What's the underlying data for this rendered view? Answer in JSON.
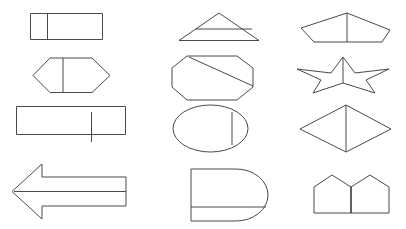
{
  "canvas": {
    "width": 406,
    "height": 229,
    "background_color": "#ffffff",
    "stroke_color": "#4a4a4a",
    "stroke_width": 1,
    "fill": "none",
    "description": "Grid of twelve black-and-white geometric outline figures, three columns by four rows, each shape drawn as thin dark-gray strokes on white with an internal dividing line"
  },
  "grid": {
    "columns": 3,
    "rows": 4,
    "total_shapes": 12
  },
  "shapes": [
    {
      "id": "shape-r1c1",
      "name": "rectangle-with-vertical-divider",
      "row": 1,
      "column": 1,
      "outline_type": "rectangle",
      "divider": "vertical-line-near-left",
      "bounds": {
        "x": 30,
        "y": 13,
        "width": 73,
        "height": 27
      }
    },
    {
      "id": "shape-r1c2",
      "name": "triangle-with-horizontal-divider",
      "row": 1,
      "column": 2,
      "outline_type": "triangle",
      "divider": "horizontal-line",
      "bounds": {
        "x": 178,
        "y": 13,
        "width": 84,
        "height": 28
      }
    },
    {
      "id": "shape-r1c3",
      "name": "pentagon-with-vertical-divider",
      "row": 1,
      "column": 3,
      "outline_type": "flattened-pentagon",
      "divider": "vertical-line-apex-to-base",
      "bounds": {
        "x": 300,
        "y": 13,
        "width": 90,
        "height": 29
      }
    },
    {
      "id": "shape-r2c1",
      "name": "hexagon-with-vertical-divider",
      "row": 2,
      "column": 1,
      "outline_type": "hexagon",
      "divider": "vertical-line-center",
      "bounds": {
        "x": 32,
        "y": 57,
        "width": 78,
        "height": 36
      }
    },
    {
      "id": "shape-r2c2",
      "name": "octagon-with-diagonal-divider",
      "row": 2,
      "column": 2,
      "outline_type": "octagon",
      "divider": "diagonal-line-upper-left-to-right",
      "bounds": {
        "x": 171,
        "y": 55,
        "width": 82,
        "height": 45
      }
    },
    {
      "id": "shape-r2c3",
      "name": "star-with-vertical-divider",
      "row": 2,
      "column": 3,
      "outline_type": "five-pointed-star-wide",
      "divider": "vertical-line-from-top-point",
      "bounds": {
        "x": 296,
        "y": 56,
        "width": 92,
        "height": 37
      }
    },
    {
      "id": "shape-r3c1",
      "name": "wide-rectangle-with-vertical-divider",
      "row": 3,
      "column": 1,
      "outline_type": "rectangle",
      "divider": "vertical-line-right-of-center-overhanging",
      "bounds": {
        "x": 16,
        "y": 106,
        "width": 110,
        "height": 29
      }
    },
    {
      "id": "shape-r3c2",
      "name": "ellipse-with-vertical-chord",
      "row": 3,
      "column": 2,
      "outline_type": "ellipse",
      "divider": "vertical-chord-right-side",
      "bounds": {
        "x": 172,
        "y": 104,
        "width": 76,
        "height": 48
      }
    },
    {
      "id": "shape-r3c3",
      "name": "rhombus-with-vertical-divider",
      "row": 3,
      "column": 3,
      "outline_type": "rhombus",
      "divider": "vertical-line-top-to-bottom-vertex",
      "bounds": {
        "x": 299,
        "y": 104,
        "width": 92,
        "height": 48
      }
    },
    {
      "id": "shape-r4c1",
      "name": "left-arrow-with-horizontal-divider",
      "row": 4,
      "column": 1,
      "outline_type": "left-pointing-block-arrow",
      "divider": "horizontal-line-through-shaft",
      "bounds": {
        "x": 11,
        "y": 163,
        "width": 115,
        "height": 55
      }
    },
    {
      "id": "shape-r4c2",
      "name": "d-shape-with-horizontal-divider",
      "row": 4,
      "column": 2,
      "outline_type": "rounded-right-rectangle",
      "divider": "horizontal-line-lower-third",
      "bounds": {
        "x": 190,
        "y": 168,
        "width": 78,
        "height": 53
      }
    },
    {
      "id": "shape-r4c3",
      "name": "double-pentagon-pair",
      "row": 4,
      "column": 3,
      "outline_type": "two-adjacent-house-pentagons",
      "divider": "shared-vertical-edge-center",
      "bounds": {
        "x": 313,
        "y": 174,
        "width": 76,
        "height": 39
      }
    }
  ]
}
